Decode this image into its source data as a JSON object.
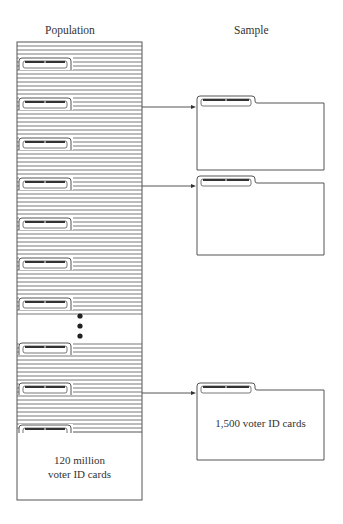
{
  "figure": {
    "population_title": "Population",
    "sample_title": "Sample",
    "population_caption_line1": "120 million",
    "population_caption_line2": "voter ID cards",
    "sample_caption": "1,500 voter ID cards"
  },
  "colors": {
    "line": "#555555",
    "tab_bar": "#333333",
    "background": "#ffffff"
  },
  "population": {
    "box": {
      "x": 17,
      "y": 42,
      "w": 125,
      "bottom": 500
    },
    "upper_section": {
      "top": 42,
      "bottom": 316
    },
    "lower_section": {
      "top": 340,
      "bottom": 432
    },
    "line_spacing": 4,
    "tab_y": [
      58,
      98,
      138,
      178,
      218,
      258,
      298,
      343,
      383,
      425
    ],
    "ellipsis_dots": [
      {
        "x": 80,
        "y": 316
      },
      {
        "x": 80,
        "y": 326
      },
      {
        "x": 80,
        "y": 336
      }
    ]
  },
  "samples": [
    {
      "tab_top": 96,
      "top": 103,
      "bottom": 170,
      "arrow_y": 107,
      "caption": ""
    },
    {
      "tab_top": 176,
      "top": 183,
      "bottom": 255,
      "arrow_y": 186,
      "caption": ""
    },
    {
      "tab_top": 383,
      "top": 390,
      "bottom": 460,
      "arrow_y": 393,
      "caption": "1,500 voter ID cards"
    }
  ],
  "sample_box": {
    "x": 197,
    "right": 324,
    "tab_w": 58
  }
}
